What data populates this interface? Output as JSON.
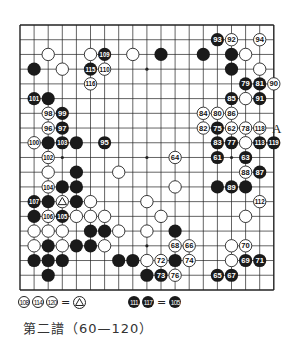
{
  "board": {
    "size": 19,
    "origin_x": 20,
    "origin_y": 25,
    "step_x": 14.1,
    "step_y": 14.72,
    "line_color": "#222222",
    "star_points": [
      [
        3,
        3
      ],
      [
        9,
        3
      ],
      [
        15,
        3
      ],
      [
        3,
        9
      ],
      [
        9,
        9
      ],
      [
        15,
        9
      ],
      [
        3,
        15
      ],
      [
        9,
        15
      ],
      [
        15,
        15
      ]
    ],
    "stones": [
      {
        "c": 15,
        "r": 1,
        "color": "W",
        "label": "92"
      },
      {
        "c": 14,
        "r": 1,
        "color": "B",
        "label": "93"
      },
      {
        "c": 17,
        "r": 1,
        "color": "W",
        "label": "94"
      },
      {
        "c": 2,
        "r": 2,
        "color": "W",
        "label": ""
      },
      {
        "c": 5,
        "r": 2,
        "color": "W",
        "label": ""
      },
      {
        "c": 6,
        "r": 2,
        "color": "B",
        "label": "109"
      },
      {
        "c": 8,
        "r": 2,
        "color": "W",
        "label": ""
      },
      {
        "c": 10,
        "r": 2,
        "color": "B",
        "label": ""
      },
      {
        "c": 13,
        "r": 2,
        "color": "B",
        "label": ""
      },
      {
        "c": 15,
        "r": 2,
        "color": "B",
        "label": ""
      },
      {
        "c": 16,
        "r": 2,
        "color": "W",
        "label": ""
      },
      {
        "c": 1,
        "r": 3,
        "color": "B",
        "label": ""
      },
      {
        "c": 3,
        "r": 3,
        "color": "W",
        "label": ""
      },
      {
        "c": 5,
        "r": 3,
        "color": "B",
        "label": "115"
      },
      {
        "c": 6,
        "r": 3,
        "color": "W",
        "label": "110"
      },
      {
        "c": 15,
        "r": 3,
        "color": "B",
        "label": ""
      },
      {
        "c": 17,
        "r": 3,
        "color": "W",
        "label": ""
      },
      {
        "c": 5,
        "r": 4,
        "color": "W",
        "label": "116"
      },
      {
        "c": 16,
        "r": 4,
        "color": "B",
        "label": "79"
      },
      {
        "c": 17,
        "r": 4,
        "color": "B",
        "label": "81"
      },
      {
        "c": 18,
        "r": 4,
        "color": "W",
        "label": "90"
      },
      {
        "c": 1,
        "r": 5,
        "color": "B",
        "label": "101"
      },
      {
        "c": 2,
        "r": 5,
        "color": "B",
        "label": ""
      },
      {
        "c": 15,
        "r": 5,
        "color": "B",
        "label": "85"
      },
      {
        "c": 16,
        "r": 5,
        "color": "W",
        "label": ""
      },
      {
        "c": 17,
        "r": 5,
        "color": "B",
        "label": "91"
      },
      {
        "c": 2,
        "r": 6,
        "color": "W",
        "label": "98"
      },
      {
        "c": 3,
        "r": 6,
        "color": "B",
        "label": "99"
      },
      {
        "c": 13,
        "r": 6,
        "color": "W",
        "label": "84"
      },
      {
        "c": 14,
        "r": 6,
        "color": "W",
        "label": "80"
      },
      {
        "c": 15,
        "r": 6,
        "color": "W",
        "label": "86"
      },
      {
        "c": 2,
        "r": 7,
        "color": "W",
        "label": "96"
      },
      {
        "c": 3,
        "r": 7,
        "color": "B",
        "label": "97"
      },
      {
        "c": 13,
        "r": 7,
        "color": "W",
        "label": "82"
      },
      {
        "c": 14,
        "r": 7,
        "color": "B",
        "label": "75"
      },
      {
        "c": 15,
        "r": 7,
        "color": "W",
        "label": "62"
      },
      {
        "c": 16,
        "r": 7,
        "color": "W",
        "label": "78"
      },
      {
        "c": 17,
        "r": 7,
        "color": "W",
        "label": "118"
      },
      {
        "c": 1,
        "r": 8,
        "color": "W",
        "label": "100"
      },
      {
        "c": 2,
        "r": 8,
        "color": "B",
        "label": ""
      },
      {
        "c": 3,
        "r": 8,
        "color": "B",
        "label": "103"
      },
      {
        "c": 4,
        "r": 8,
        "color": "B",
        "label": ""
      },
      {
        "c": 6,
        "r": 8,
        "color": "B",
        "label": "95"
      },
      {
        "c": 14,
        "r": 8,
        "color": "B",
        "label": "83"
      },
      {
        "c": 15,
        "r": 8,
        "color": "B",
        "label": "77"
      },
      {
        "c": 16,
        "r": 8,
        "color": "W",
        "label": ""
      },
      {
        "c": 17,
        "r": 8,
        "color": "B",
        "label": "113"
      },
      {
        "c": 18,
        "r": 8,
        "color": "B",
        "label": "119"
      },
      {
        "c": 2,
        "r": 9,
        "color": "W",
        "label": "102"
      },
      {
        "c": 11,
        "r": 9,
        "color": "W",
        "label": "64"
      },
      {
        "c": 14,
        "r": 9,
        "color": "B",
        "label": "61"
      },
      {
        "c": 16,
        "r": 9,
        "color": "B",
        "label": "63"
      },
      {
        "c": 2,
        "r": 10,
        "color": "W",
        "label": ""
      },
      {
        "c": 4,
        "r": 10,
        "color": "B",
        "label": ""
      },
      {
        "c": 7,
        "r": 10,
        "color": "W",
        "label": ""
      },
      {
        "c": 16,
        "r": 10,
        "color": "W",
        "label": "88"
      },
      {
        "c": 17,
        "r": 10,
        "color": "B",
        "label": "87"
      },
      {
        "c": 2,
        "r": 11,
        "color": "W",
        "label": "104"
      },
      {
        "c": 3,
        "r": 11,
        "color": "B",
        "label": ""
      },
      {
        "c": 4,
        "r": 11,
        "color": "B",
        "label": ""
      },
      {
        "c": 11,
        "r": 11,
        "color": "W",
        "label": ""
      },
      {
        "c": 14,
        "r": 11,
        "color": "B",
        "label": ""
      },
      {
        "c": 15,
        "r": 11,
        "color": "B",
        "label": "89"
      },
      {
        "c": 16,
        "r": 11,
        "color": "B",
        "label": ""
      },
      {
        "c": 1,
        "r": 12,
        "color": "B",
        "label": "107"
      },
      {
        "c": 2,
        "r": 12,
        "color": "B",
        "label": ""
      },
      {
        "c": 3,
        "r": 12,
        "color": "W",
        "label": "",
        "mark": "triangle"
      },
      {
        "c": 4,
        "r": 12,
        "color": "B",
        "label": ""
      },
      {
        "c": 5,
        "r": 12,
        "color": "W",
        "label": ""
      },
      {
        "c": 9,
        "r": 12,
        "color": "W",
        "label": ""
      },
      {
        "c": 17,
        "r": 12,
        "color": "W",
        "label": "112"
      },
      {
        "c": 1,
        "r": 13,
        "color": "B",
        "label": ""
      },
      {
        "c": 2,
        "r": 13,
        "color": "W",
        "label": "106"
      },
      {
        "c": 3,
        "r": 13,
        "color": "B",
        "label": "105"
      },
      {
        "c": 4,
        "r": 13,
        "color": "W",
        "label": ""
      },
      {
        "c": 5,
        "r": 13,
        "color": "W",
        "label": ""
      },
      {
        "c": 6,
        "r": 13,
        "color": "W",
        "label": ""
      },
      {
        "c": 10,
        "r": 13,
        "color": "W",
        "label": ""
      },
      {
        "c": 16,
        "r": 13,
        "color": "W",
        "label": ""
      },
      {
        "c": 1,
        "r": 14,
        "color": "W",
        "label": ""
      },
      {
        "c": 2,
        "r": 14,
        "color": "W",
        "label": ""
      },
      {
        "c": 3,
        "r": 14,
        "color": "W",
        "label": ""
      },
      {
        "c": 5,
        "r": 14,
        "color": "B",
        "label": ""
      },
      {
        "c": 6,
        "r": 14,
        "color": "B",
        "label": ""
      },
      {
        "c": 7,
        "r": 14,
        "color": "W",
        "label": ""
      },
      {
        "c": 9,
        "r": 14,
        "color": "W",
        "label": ""
      },
      {
        "c": 11,
        "r": 14,
        "color": "B",
        "label": ""
      },
      {
        "c": 1,
        "r": 15,
        "color": "W",
        "label": ""
      },
      {
        "c": 2,
        "r": 15,
        "color": "B",
        "label": ""
      },
      {
        "c": 3,
        "r": 15,
        "color": "W",
        "label": ""
      },
      {
        "c": 4,
        "r": 15,
        "color": "B",
        "label": ""
      },
      {
        "c": 5,
        "r": 15,
        "color": "B",
        "label": ""
      },
      {
        "c": 6,
        "r": 15,
        "color": "W",
        "label": ""
      },
      {
        "c": 11,
        "r": 15,
        "color": "W",
        "label": "68"
      },
      {
        "c": 12,
        "r": 15,
        "color": "W",
        "label": "66"
      },
      {
        "c": 15,
        "r": 15,
        "color": "W",
        "label": ""
      },
      {
        "c": 16,
        "r": 15,
        "color": "W",
        "label": "70"
      },
      {
        "c": 1,
        "r": 16,
        "color": "B",
        "label": ""
      },
      {
        "c": 2,
        "r": 16,
        "color": "B",
        "label": ""
      },
      {
        "c": 3,
        "r": 16,
        "color": "B",
        "label": ""
      },
      {
        "c": 7,
        "r": 16,
        "color": "B",
        "label": ""
      },
      {
        "c": 8,
        "r": 16,
        "color": "B",
        "label": ""
      },
      {
        "c": 9,
        "r": 16,
        "color": "W",
        "label": ""
      },
      {
        "c": 10,
        "r": 16,
        "color": "W",
        "label": "72"
      },
      {
        "c": 11,
        "r": 16,
        "color": "B",
        "label": ""
      },
      {
        "c": 12,
        "r": 16,
        "color": "W",
        "label": "74"
      },
      {
        "c": 15,
        "r": 16,
        "color": "W",
        "label": ""
      },
      {
        "c": 16,
        "r": 16,
        "color": "B",
        "label": "69"
      },
      {
        "c": 17,
        "r": 16,
        "color": "B",
        "label": "71"
      },
      {
        "c": 2,
        "r": 17,
        "color": "B",
        "label": ""
      },
      {
        "c": 9,
        "r": 17,
        "color": "B",
        "label": ""
      },
      {
        "c": 10,
        "r": 17,
        "color": "B",
        "label": "73"
      },
      {
        "c": 11,
        "r": 17,
        "color": "W",
        "label": "76"
      },
      {
        "c": 14,
        "r": 17,
        "color": "B",
        "label": "65"
      },
      {
        "c": 15,
        "r": 17,
        "color": "B",
        "label": "67"
      }
    ],
    "annotations": [
      {
        "c": 18,
        "r": 7,
        "text": "A"
      }
    ]
  },
  "legend": {
    "left": {
      "stones": [
        {
          "color": "W",
          "label": "108"
        },
        {
          "color": "W",
          "label": "114"
        },
        {
          "color": "W",
          "label": "120"
        }
      ],
      "equals": "=",
      "target": "triangle"
    },
    "right": {
      "stones": [
        {
          "color": "B",
          "label": "111"
        },
        {
          "color": "B",
          "label": "117"
        }
      ],
      "equals": "=",
      "target": {
        "color": "B",
        "label": "105"
      }
    }
  },
  "caption": "第二譜（60—120）"
}
